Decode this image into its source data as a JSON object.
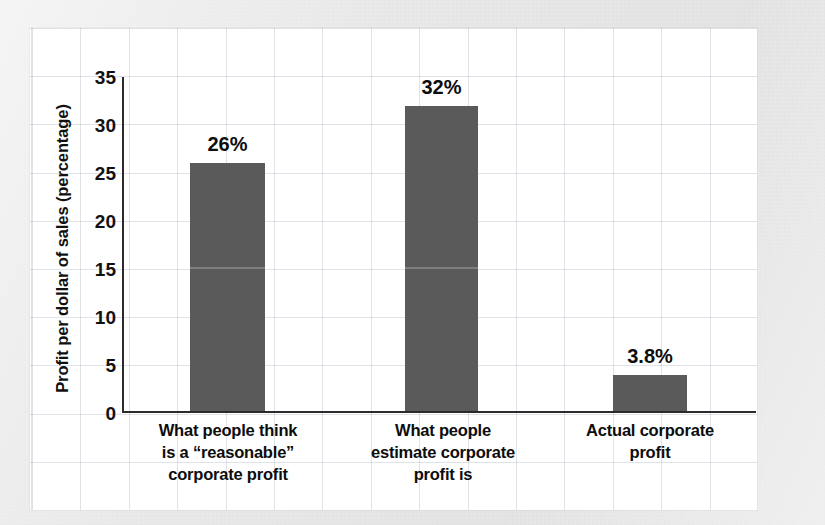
{
  "chart_data": {
    "type": "bar",
    "title": "",
    "subtitle": "",
    "xlabel": "",
    "ylabel": "Profit per dollar of sales (percentage)",
    "ylim": [
      0,
      35
    ],
    "ytick_labels": [
      "35",
      "30",
      "25",
      "20",
      "15",
      "10",
      "5",
      "0"
    ],
    "ytick_values": [
      35,
      30,
      25,
      20,
      15,
      10,
      5,
      0
    ],
    "grid": true,
    "grid_style": "graph-paper",
    "legend": "none",
    "categories": [
      "What people think is a “reasonable” corporate profit",
      "What people estimate corporate profit is",
      "Actual corporate profit"
    ],
    "category_lines": [
      [
        "What people think",
        "is a “reasonable”",
        "corporate profit"
      ],
      [
        "What people",
        "estimate corporate",
        "profit is"
      ],
      [
        "Actual corporate",
        "profit"
      ]
    ],
    "values": [
      26,
      32,
      3.8
    ],
    "data_labels": [
      "26%",
      "32%",
      "3.8%"
    ],
    "bar_color": "#5a5a5a",
    "axis_color": "#2b2b2b",
    "text_color": "#0d0d0d",
    "panel_color": "#ffffff",
    "background_color": "#e9e9e9",
    "gridline_color": "#96a0af"
  }
}
